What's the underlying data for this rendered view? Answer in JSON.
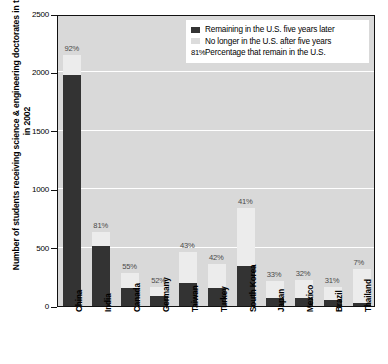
{
  "chart_data": {
    "type": "bar",
    "title": "",
    "subtitle": "",
    "xlabel": "",
    "ylabel": "Number of students receiving science & engineering doctorates in the U.S. in 2002",
    "ylim": [
      0,
      2500
    ],
    "yticks": [
      0,
      500,
      1000,
      1500,
      2000,
      2500
    ],
    "grid": true,
    "stacked": true,
    "legend_position": "top-right",
    "categories": [
      "China",
      "India",
      "Canada",
      "Germany",
      "Taiwan",
      "Turkey",
      "South Korea",
      "Japan",
      "Mexico",
      "Brazil",
      "Thailand"
    ],
    "series": [
      {
        "name": "Remaining in the U.S. five years later",
        "color": "#333333",
        "values": [
          1980,
          510,
          155,
          85,
          200,
          150,
          345,
          70,
          70,
          50,
          22
        ]
      },
      {
        "name": "No longer in the U.S. after five years",
        "color": "#ececec",
        "values": [
          172,
          120,
          127,
          78,
          265,
          207,
          496,
          142,
          149,
          111,
          291
        ]
      }
    ],
    "totals": [
      2152,
      630,
      282,
      163,
      465,
      357,
      841,
      212,
      219,
      161,
      313
    ],
    "annotations": [
      {
        "category": "China",
        "label": "92%",
        "value": 92
      },
      {
        "category": "India",
        "label": "81%",
        "value": 81
      },
      {
        "category": "Canada",
        "label": "55%",
        "value": 55
      },
      {
        "category": "Germany",
        "label": "52%",
        "value": 52
      },
      {
        "category": "Taiwan",
        "label": "43%",
        "value": 43
      },
      {
        "category": "Turkey",
        "label": "42%",
        "value": 42
      },
      {
        "category": "South Korea",
        "label": "41%",
        "value": 41
      },
      {
        "category": "Japan",
        "label": "33%",
        "value": 33
      },
      {
        "category": "Mexico",
        "label": "32%",
        "value": 32
      },
      {
        "category": "Brazil",
        "label": "31%",
        "value": 31
      },
      {
        "category": "Thailand",
        "label": "7%",
        "value": 7
      }
    ]
  },
  "legend": {
    "rows": [
      {
        "kind": "swatch-dark",
        "label": "Remaining in the U.S. five years later"
      },
      {
        "kind": "swatch-light",
        "label": "No longer in the U.S. after five years"
      },
      {
        "kind": "pct",
        "pct": "81%",
        "label": "Percentage that remain in the U.S."
      }
    ]
  },
  "axis": {
    "y_title": "Number of students receiving science & engineering doctorates in the U.S. in 2002",
    "y_ticks": [
      "2500",
      "2000",
      "1500",
      "1000",
      "500",
      "0"
    ]
  }
}
